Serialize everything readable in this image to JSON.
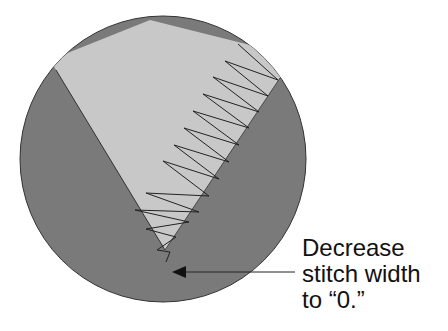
{
  "diagram": {
    "annotation": {
      "lines": [
        "Decrease",
        "stitch width",
        "to “0.”"
      ]
    },
    "colors": {
      "fabric_dark": "#7a7a7a",
      "fabric_light": "#c8c8c8",
      "stitch": "#222222",
      "outline": "#333333",
      "text": "#111111"
    }
  }
}
